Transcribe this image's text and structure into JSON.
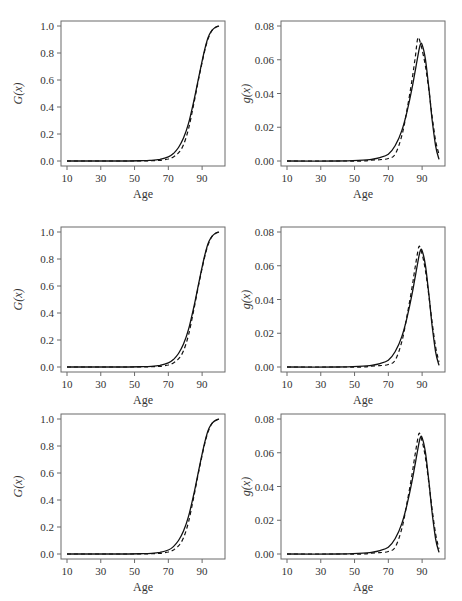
{
  "layout": {
    "rows": 3,
    "cols": 2
  },
  "chart_data": [
    {
      "panel": "row1-left",
      "type": "line",
      "xlabel": "Age",
      "ylabel": "G(x)",
      "xticks": [
        10,
        30,
        50,
        70,
        90
      ],
      "yticks": [
        "0.0",
        "0.2",
        "0.4",
        "0.6",
        "0.8",
        "1.0"
      ],
      "xlim": [
        10,
        100
      ],
      "ylim": [
        0,
        1
      ],
      "series": [
        {
          "name": "solid",
          "style": "solid",
          "x": [
            10,
            40,
            55,
            60,
            65,
            70,
            73,
            76,
            79,
            82,
            85,
            88,
            90,
            92,
            94,
            96,
            98,
            100
          ],
          "y": [
            0,
            0,
            0.002,
            0.005,
            0.012,
            0.03,
            0.055,
            0.1,
            0.17,
            0.28,
            0.44,
            0.62,
            0.74,
            0.85,
            0.93,
            0.97,
            0.99,
            1.0
          ]
        },
        {
          "name": "dashed",
          "style": "dashed",
          "x": [
            10,
            40,
            55,
            60,
            65,
            70,
            73,
            76,
            79,
            82,
            85,
            88,
            90,
            92,
            94,
            96,
            98,
            100
          ],
          "y": [
            0,
            0,
            0.0,
            0.002,
            0.005,
            0.015,
            0.03,
            0.06,
            0.12,
            0.24,
            0.42,
            0.61,
            0.73,
            0.84,
            0.92,
            0.97,
            0.99,
            1.0
          ]
        }
      ]
    },
    {
      "panel": "row1-right",
      "type": "line",
      "xlabel": "Age",
      "ylabel": "g(x)",
      "xticks": [
        10,
        30,
        50,
        70,
        90
      ],
      "yticks": [
        "0.00",
        "0.02",
        "0.04",
        "0.06",
        "0.08"
      ],
      "xlim": [
        10,
        100
      ],
      "ylim": [
        0,
        0.08
      ],
      "series": [
        {
          "name": "solid",
          "style": "solid",
          "x": [
            10,
            40,
            55,
            60,
            65,
            70,
            74,
            78,
            81,
            84,
            86,
            88,
            89,
            90,
            92,
            94,
            96,
            98,
            100
          ],
          "y": [
            0,
            0,
            0.0005,
            0.001,
            0.002,
            0.004,
            0.009,
            0.018,
            0.029,
            0.043,
            0.054,
            0.065,
            0.069,
            0.069,
            0.06,
            0.043,
            0.024,
            0.009,
            0.001
          ]
        },
        {
          "name": "dashed",
          "style": "dashed",
          "x": [
            10,
            40,
            55,
            60,
            65,
            70,
            74,
            78,
            81,
            84,
            86,
            87.5,
            89,
            90,
            92,
            94,
            96,
            98,
            100
          ],
          "y": [
            0,
            0,
            0,
            0.0005,
            0.0008,
            0.0015,
            0.004,
            0.015,
            0.03,
            0.048,
            0.062,
            0.073,
            0.07,
            0.066,
            0.056,
            0.042,
            0.026,
            0.012,
            0.004
          ]
        }
      ]
    },
    {
      "panel": "row2-left",
      "type": "line",
      "xlabel": "Age",
      "ylabel": "G(x)",
      "xticks": [
        10,
        30,
        50,
        70,
        90
      ],
      "yticks": [
        "0.0",
        "0.2",
        "0.4",
        "0.6",
        "0.8",
        "1.0"
      ],
      "xlim": [
        10,
        100
      ],
      "ylim": [
        0,
        1
      ],
      "series": [
        {
          "name": "solid",
          "style": "solid",
          "x": [
            10,
            40,
            55,
            60,
            65,
            70,
            73,
            76,
            79,
            82,
            85,
            88,
            90,
            92,
            94,
            96,
            98,
            100
          ],
          "y": [
            0,
            0,
            0.002,
            0.005,
            0.012,
            0.03,
            0.055,
            0.1,
            0.17,
            0.28,
            0.44,
            0.62,
            0.74,
            0.85,
            0.93,
            0.97,
            0.99,
            1.0
          ]
        },
        {
          "name": "dashed",
          "style": "dashed",
          "x": [
            10,
            40,
            55,
            60,
            65,
            70,
            73,
            76,
            79,
            82,
            85,
            88,
            90,
            92,
            94,
            96,
            98,
            100
          ],
          "y": [
            0,
            0,
            0.0,
            0.002,
            0.005,
            0.015,
            0.03,
            0.06,
            0.12,
            0.24,
            0.42,
            0.61,
            0.73,
            0.84,
            0.92,
            0.97,
            0.99,
            1.0
          ]
        }
      ]
    },
    {
      "panel": "row2-right",
      "type": "line",
      "xlabel": "Age",
      "ylabel": "g(x)",
      "xticks": [
        10,
        30,
        50,
        70,
        90
      ],
      "yticks": [
        "0.00",
        "0.02",
        "0.04",
        "0.06",
        "0.08"
      ],
      "xlim": [
        10,
        100
      ],
      "ylim": [
        0,
        0.08
      ],
      "series": [
        {
          "name": "solid",
          "style": "solid",
          "x": [
            10,
            40,
            55,
            60,
            65,
            70,
            74,
            78,
            81,
            84,
            86,
            88,
            89,
            90,
            92,
            94,
            96,
            98,
            100
          ],
          "y": [
            0,
            0,
            0.0005,
            0.001,
            0.002,
            0.004,
            0.009,
            0.018,
            0.029,
            0.043,
            0.054,
            0.065,
            0.069,
            0.069,
            0.06,
            0.043,
            0.024,
            0.009,
            0.001
          ]
        },
        {
          "name": "dashed",
          "style": "dashed",
          "x": [
            10,
            40,
            55,
            60,
            65,
            70,
            74,
            78,
            81,
            84,
            86,
            88,
            89,
            90,
            92,
            94,
            96,
            98,
            100
          ],
          "y": [
            0,
            0,
            0,
            0.0005,
            0.0008,
            0.0015,
            0.004,
            0.015,
            0.03,
            0.047,
            0.06,
            0.071,
            0.07,
            0.067,
            0.057,
            0.042,
            0.026,
            0.012,
            0.003
          ]
        }
      ]
    },
    {
      "panel": "row3-left",
      "type": "line",
      "xlabel": "Age",
      "ylabel": "G(x)",
      "xticks": [
        10,
        30,
        50,
        70,
        90
      ],
      "yticks": [
        "0.0",
        "0.2",
        "0.4",
        "0.6",
        "0.8",
        "1.0"
      ],
      "xlim": [
        10,
        100
      ],
      "ylim": [
        0,
        1
      ],
      "series": [
        {
          "name": "solid",
          "style": "solid",
          "x": [
            10,
            40,
            55,
            60,
            65,
            70,
            73,
            76,
            79,
            82,
            85,
            88,
            90,
            92,
            94,
            96,
            98,
            100
          ],
          "y": [
            0,
            0,
            0.002,
            0.005,
            0.012,
            0.03,
            0.055,
            0.1,
            0.17,
            0.28,
            0.44,
            0.62,
            0.74,
            0.85,
            0.93,
            0.97,
            0.99,
            1.0
          ]
        },
        {
          "name": "dashed",
          "style": "dashed",
          "x": [
            10,
            40,
            55,
            60,
            65,
            70,
            73,
            76,
            79,
            82,
            85,
            88,
            90,
            92,
            94,
            96,
            98,
            100
          ],
          "y": [
            0,
            0,
            0.0,
            0.002,
            0.005,
            0.015,
            0.03,
            0.06,
            0.12,
            0.24,
            0.42,
            0.61,
            0.73,
            0.84,
            0.92,
            0.97,
            0.99,
            1.0
          ]
        }
      ]
    },
    {
      "panel": "row3-right",
      "type": "line",
      "xlabel": "Age",
      "ylabel": "g(x)",
      "xticks": [
        10,
        30,
        50,
        70,
        90
      ],
      "yticks": [
        "0.00",
        "0.02",
        "0.04",
        "0.06",
        "0.08"
      ],
      "xlim": [
        10,
        100
      ],
      "ylim": [
        0,
        0.08
      ],
      "series": [
        {
          "name": "solid",
          "style": "solid",
          "x": [
            10,
            40,
            55,
            60,
            65,
            70,
            74,
            78,
            81,
            84,
            86,
            88,
            89,
            90,
            92,
            94,
            96,
            98,
            100
          ],
          "y": [
            0,
            0,
            0.0005,
            0.001,
            0.002,
            0.004,
            0.009,
            0.018,
            0.029,
            0.043,
            0.054,
            0.065,
            0.069,
            0.069,
            0.06,
            0.043,
            0.024,
            0.009,
            0.001
          ]
        },
        {
          "name": "dashed",
          "style": "dashed",
          "x": [
            10,
            40,
            55,
            60,
            65,
            70,
            74,
            78,
            81,
            84,
            86,
            88,
            89,
            90,
            92,
            94,
            96,
            98,
            100
          ],
          "y": [
            0,
            0,
            0,
            0.0005,
            0.0008,
            0.0015,
            0.004,
            0.015,
            0.03,
            0.047,
            0.06,
            0.071,
            0.07,
            0.067,
            0.057,
            0.042,
            0.026,
            0.012,
            0.003
          ]
        }
      ]
    }
  ]
}
